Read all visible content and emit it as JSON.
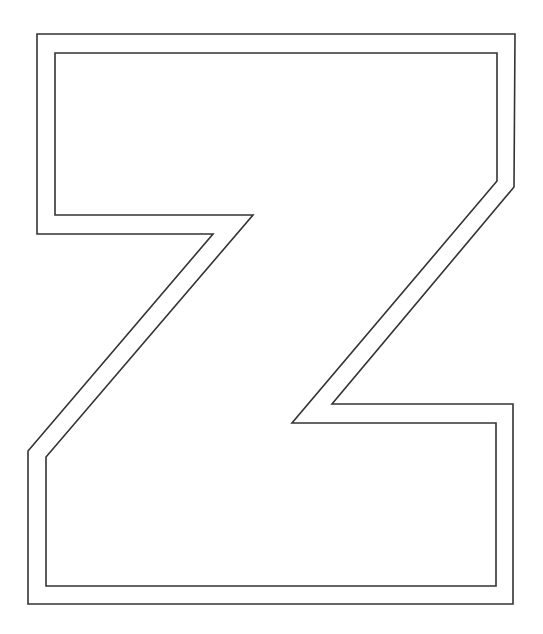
{
  "image": {
    "subject": "Outlined letter Z",
    "letter": "Z",
    "style": "double outline, no fill",
    "background": "#ffffff",
    "stroke_color": "#333333",
    "width": 543,
    "height": 634
  },
  "outlines": {
    "outer": {
      "points": "37,34 515,34 514,187 332,404 513,404 513,604 28,604 28,451 213,234 37,234"
    },
    "inner": {
      "points": "55,53 497,53 497,181 292,423 496,423 496,586 46,586 46,457 253,215 55,215"
    }
  }
}
